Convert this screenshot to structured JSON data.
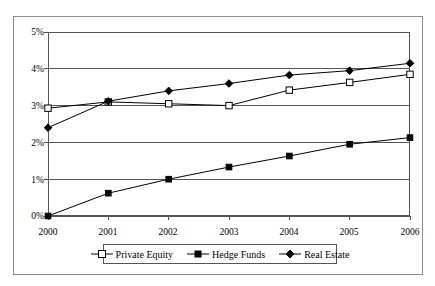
{
  "chart_data": {
    "type": "line",
    "title": "",
    "subtitle": "",
    "xlabel": "",
    "ylabel": "",
    "categories": [
      "2000",
      "2001",
      "2002",
      "2003",
      "2004",
      "2005",
      "2006"
    ],
    "x": [
      2000,
      2001,
      2002,
      2003,
      2004,
      2005,
      2006
    ],
    "series": [
      {
        "name": "Private Equity",
        "marker": "open-square",
        "color": "#000000",
        "values": [
          2.93,
          3.1,
          3.05,
          3.0,
          3.42,
          3.63,
          3.85
        ]
      },
      {
        "name": "Hedge Funds",
        "marker": "filled-square",
        "color": "#000000",
        "values": [
          0.0,
          0.62,
          1.0,
          1.33,
          1.63,
          1.95,
          2.13
        ]
      },
      {
        "name": "Real Estate",
        "marker": "filled-diamond",
        "color": "#000000",
        "values": [
          2.4,
          3.12,
          3.4,
          3.6,
          3.83,
          3.95,
          4.15
        ]
      }
    ],
    "ylim": [
      0,
      5
    ],
    "ytick_values": [
      0,
      1,
      2,
      3,
      4,
      5
    ],
    "ytick_labels": [
      "0%",
      "1%",
      "2%",
      "3%",
      "4%",
      "5%"
    ],
    "xlim": [
      2000,
      2006
    ],
    "grid": "horizontal",
    "legend_position": "bottom",
    "legend_entries": [
      "Private Equity",
      "Hedge Funds",
      "Real Estate"
    ],
    "annotations": []
  },
  "axes": {
    "y_ticks": [
      {
        "label": "5%",
        "value": 5
      },
      {
        "label": "4%",
        "value": 4
      },
      {
        "label": "3%",
        "value": 3
      },
      {
        "label": "2%",
        "value": 2
      },
      {
        "label": "1%",
        "value": 1
      },
      {
        "label": "0%",
        "value": 0
      }
    ],
    "x_ticks": [
      {
        "label": "2000"
      },
      {
        "label": "2001"
      },
      {
        "label": "2002"
      },
      {
        "label": "2003"
      },
      {
        "label": "2004"
      },
      {
        "label": "2005"
      },
      {
        "label": "2006"
      }
    ]
  },
  "legend": {
    "items": [
      {
        "label": "Private Equity",
        "marker": "open-square"
      },
      {
        "label": "Hedge Funds",
        "marker": "filled-square"
      },
      {
        "label": "Real Estate",
        "marker": "filled-diamond"
      }
    ]
  },
  "colors": {
    "line": "#000000",
    "grid": "#555555",
    "frame": "#8c8c8c",
    "background": "#ffffff"
  }
}
